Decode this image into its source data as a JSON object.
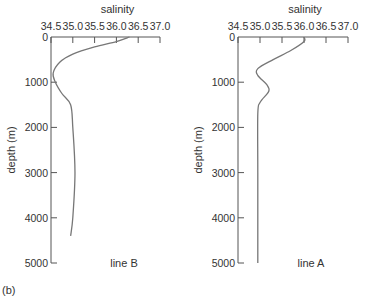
{
  "figure_label": "(b)",
  "chart_data": [
    {
      "type": "line",
      "title": "line B",
      "xlabel": "salinity",
      "ylabel": "depth (m)",
      "x_ticks": [
        "34.5",
        "35.0",
        "35.5",
        "36.0",
        "36.5",
        "37.0"
      ],
      "y_ticks": [
        "0",
        "1000",
        "2000",
        "3000",
        "4000",
        "5000"
      ],
      "xlim": [
        34.5,
        37.0
      ],
      "ylim": [
        0,
        5000
      ],
      "y_inverted": true,
      "x_axis_position": "top",
      "grid": false,
      "series": [
        {
          "name": "line B",
          "points": [
            {
              "salinity": 36.3,
              "depth": 0
            },
            {
              "salinity": 36.0,
              "depth": 100
            },
            {
              "salinity": 35.5,
              "depth": 220
            },
            {
              "salinity": 35.0,
              "depth": 380
            },
            {
              "salinity": 34.7,
              "depth": 560
            },
            {
              "salinity": 34.55,
              "depth": 800
            },
            {
              "salinity": 34.6,
              "depth": 1000
            },
            {
              "salinity": 34.75,
              "depth": 1250
            },
            {
              "salinity": 34.95,
              "depth": 1500
            },
            {
              "salinity": 35.0,
              "depth": 2000
            },
            {
              "salinity": 35.05,
              "depth": 3000
            },
            {
              "salinity": 35.0,
              "depth": 4000
            },
            {
              "salinity": 34.95,
              "depth": 4400
            }
          ]
        }
      ]
    },
    {
      "type": "line",
      "title": "line A",
      "xlabel": "salinity",
      "ylabel": "depth (m)",
      "x_ticks": [
        "34.5",
        "35.0",
        "35.5",
        "36.0",
        "36.5",
        "37.0"
      ],
      "y_ticks": [
        "0",
        "1000",
        "2000",
        "3000",
        "4000",
        "5000"
      ],
      "xlim": [
        34.5,
        37.0
      ],
      "ylim": [
        0,
        5000
      ],
      "y_inverted": true,
      "x_axis_position": "top",
      "grid": false,
      "series": [
        {
          "name": "line A",
          "points": [
            {
              "salinity": 36.0,
              "depth": 0
            },
            {
              "salinity": 36.0,
              "depth": 100
            },
            {
              "salinity": 35.7,
              "depth": 300
            },
            {
              "salinity": 35.3,
              "depth": 500
            },
            {
              "salinity": 34.95,
              "depth": 700
            },
            {
              "salinity": 34.95,
              "depth": 850
            },
            {
              "salinity": 35.15,
              "depth": 1050
            },
            {
              "salinity": 35.2,
              "depth": 1200
            },
            {
              "salinity": 35.0,
              "depth": 1450
            },
            {
              "salinity": 34.95,
              "depth": 1700
            },
            {
              "salinity": 34.95,
              "depth": 3000
            },
            {
              "salinity": 34.95,
              "depth": 5000
            }
          ]
        }
      ]
    }
  ]
}
